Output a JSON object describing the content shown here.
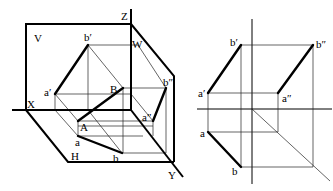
{
  "left_diagram": {
    "title": "3D projection of line AB",
    "labels": {
      "V": "V",
      "W": "W",
      "H": "H",
      "X": "X",
      "Y": "Y",
      "Z": "Z",
      "A": "A",
      "B": "B",
      "a": "a",
      "b": "b",
      "a_prime": "a′",
      "b_prime": "b′",
      "a_dprime": "a″",
      "b_dprime": "b″"
    }
  },
  "right_diagram": {
    "title": "Orthographic projections of line AB",
    "labels": {
      "a_prime": "a′",
      "b_prime": "b′",
      "a_dprime": "a″",
      "b_dprime": "b″",
      "a": "a",
      "b": "b"
    }
  }
}
